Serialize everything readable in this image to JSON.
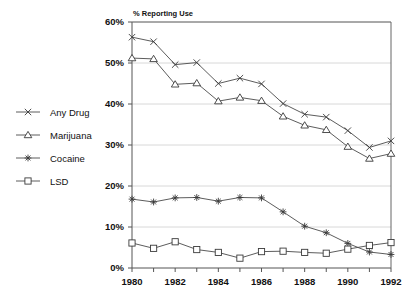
{
  "chart_data": {
    "type": "line",
    "title": "% Reporting Use",
    "xlabel": "",
    "ylabel": "",
    "x": [
      1980,
      1981,
      1982,
      1983,
      1984,
      1985,
      1986,
      1987,
      1988,
      1989,
      1990,
      1991,
      1992
    ],
    "categories": [
      "1980",
      "1981",
      "1982",
      "1983",
      "1984",
      "1985",
      "1986",
      "1987",
      "1988",
      "1989",
      "1990",
      "1991",
      "1992"
    ],
    "x_tick_labels": [
      "1980",
      "1982",
      "1984",
      "1986",
      "1988",
      "1990",
      "1992"
    ],
    "y_tick_labels": [
      "0%",
      "10%",
      "20%",
      "30%",
      "40%",
      "50%",
      "60%"
    ],
    "y_ticks": [
      0,
      10,
      20,
      30,
      40,
      50,
      60
    ],
    "ylim": [
      0,
      60
    ],
    "xlim": [
      1980,
      1992
    ],
    "grid": true,
    "legend_position": "left-outside",
    "series": [
      {
        "name": "Any Drug",
        "marker": "x-cross",
        "values": [
          56.3,
          55.2,
          49.6,
          50.1,
          45.0,
          46.3,
          44.9,
          40.1,
          37.5,
          36.8,
          33.5,
          29.4,
          31.0
        ]
      },
      {
        "name": "Marijuana",
        "marker": "triangle",
        "values": [
          51.2,
          51.0,
          44.8,
          45.1,
          40.7,
          41.6,
          40.8,
          37.0,
          34.8,
          33.7,
          29.6,
          26.7,
          27.9
        ]
      },
      {
        "name": "Cocaine",
        "marker": "asterisk",
        "values": [
          16.8,
          16.1,
          17.1,
          17.2,
          16.3,
          17.2,
          17.1,
          13.7,
          10.2,
          8.6,
          6.0,
          3.9,
          3.3
        ]
      },
      {
        "name": "LSD",
        "marker": "square",
        "values": [
          6.1,
          4.8,
          6.4,
          4.5,
          3.8,
          2.4,
          4.0,
          4.1,
          3.8,
          3.6,
          4.6,
          5.5,
          6.2
        ]
      }
    ]
  },
  "legend": {
    "items": [
      {
        "label": "Any Drug",
        "marker": "x-cross"
      },
      {
        "label": "Marijuana",
        "marker": "triangle"
      },
      {
        "label": "Cocaine",
        "marker": "asterisk"
      },
      {
        "label": "LSD",
        "marker": "square"
      }
    ]
  }
}
